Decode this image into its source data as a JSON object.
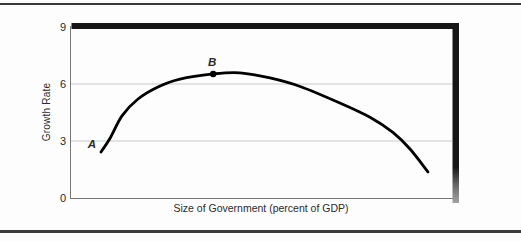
{
  "figure": {
    "top_rule": "visible",
    "bottom_rule": "visible",
    "background": "#fdfdfd"
  },
  "chart_data": {
    "type": "line",
    "title": "",
    "xlabel": "Size of Government (percent of GDP)",
    "ylabel": "Growth Rate",
    "x_axis": {
      "tick_labels_shown": false,
      "unit": "percent of GDP"
    },
    "y_axis": {
      "ticks": [
        0,
        3,
        6,
        9
      ],
      "lim": [
        0,
        9
      ]
    },
    "grid": "horizontal-light",
    "legend": "none",
    "series": [
      {
        "name": "growth-curve",
        "x_pct": [
          8.0,
          10.4,
          13.5,
          17.7,
          22.9,
          28.7,
          37.4,
          44.4,
          52.3,
          60.2,
          70.6,
          78.5,
          84.5,
          89.0,
          93.7
        ],
        "growth": [
          2.42,
          3.16,
          4.32,
          5.21,
          5.84,
          6.26,
          6.53,
          6.59,
          6.32,
          5.87,
          5.0,
          4.25,
          3.45,
          2.58,
          1.37
        ]
      }
    ],
    "annotations": [
      {
        "label": "A",
        "x_pct": 5.6,
        "growth": 2.84,
        "marker": false,
        "label_offset_px": [
          0,
          0
        ]
      },
      {
        "label": "B",
        "x_pct": 37.4,
        "growth": 6.53,
        "marker": true,
        "label_offset_px": [
          -1,
          -12
        ]
      }
    ],
    "colors": {
      "curve": "#000000",
      "gridline": "#c9c9c9",
      "axis": "#777777",
      "frame_bar": "#161616",
      "frame_bar_shadow": "#a3a3a3",
      "rule": "#3b3b3b"
    }
  }
}
